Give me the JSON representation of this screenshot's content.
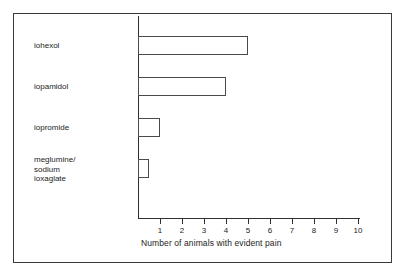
{
  "chart_data": {
    "type": "bar",
    "orientation": "horizontal",
    "title": "",
    "xlabel": "Number of animals with evident pain",
    "ylabel": "",
    "categories": [
      "iohexol",
      "iopamidol",
      "iopromide",
      "meglumine/\nsodium\nioxaglate"
    ],
    "values": [
      5,
      4,
      1,
      0.5
    ],
    "xlim": [
      0,
      10.1
    ],
    "xticks": [
      1,
      2,
      3,
      4,
      5,
      6,
      7,
      8,
      9,
      10
    ],
    "xtick_labels": [
      "1",
      "2",
      "3",
      "4",
      "5",
      "6",
      "7",
      "8",
      "9",
      "10"
    ],
    "grid": false,
    "legend": null,
    "bar_style": {
      "fill": "#ffffff",
      "edge": "#4a4a4a"
    },
    "axis_color": "#2f2f2f",
    "frame_color": "#3a3a3a",
    "background": "#ffffff"
  }
}
